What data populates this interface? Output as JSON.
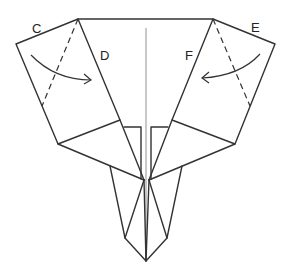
{
  "diagram": {
    "type": "origami-fold-instruction",
    "labels": {
      "c": "C",
      "d": "D",
      "e": "E",
      "f": "F"
    },
    "colors": {
      "stroke": "#333333",
      "background": "#ffffff"
    }
  }
}
